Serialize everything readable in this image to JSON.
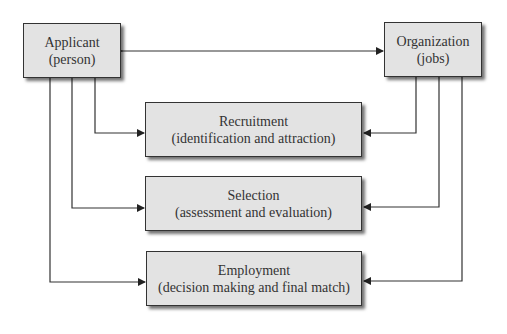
{
  "diagram": {
    "nodes": {
      "applicant": {
        "title": "Applicant",
        "subtitle": "(person)"
      },
      "organization": {
        "title": "Organization",
        "subtitle": "(jobs)"
      },
      "recruitment": {
        "title": "Recruitment",
        "subtitle": "(identification and attraction)"
      },
      "selection": {
        "title": "Selection",
        "subtitle": "(assessment and evaluation)"
      },
      "employment": {
        "title": "Employment",
        "subtitle": "(decision making and final match)"
      }
    },
    "edges": [
      {
        "from": "applicant",
        "to": "organization",
        "type": "bidirectional"
      },
      {
        "from": "applicant",
        "to": "recruitment"
      },
      {
        "from": "organization",
        "to": "recruitment"
      },
      {
        "from": "applicant",
        "to": "selection"
      },
      {
        "from": "organization",
        "to": "selection"
      },
      {
        "from": "applicant",
        "to": "employment"
      },
      {
        "from": "organization",
        "to": "employment"
      }
    ],
    "colors": {
      "box_fill": "#e3e3e3",
      "line": "#333333"
    }
  }
}
